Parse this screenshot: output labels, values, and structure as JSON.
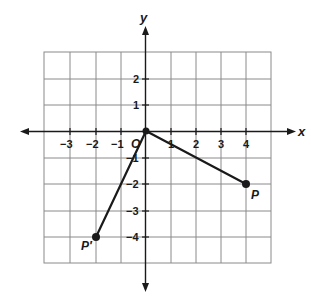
{
  "diagram": {
    "type": "coordinate-plane",
    "axes": {
      "x_label": "x",
      "y_label": "y",
      "x_ticks": [
        "−3",
        "−2",
        "−1",
        "1",
        "2",
        "3",
        "4"
      ],
      "y_ticks": [
        "2",
        "1",
        "−1",
        "−2",
        "−3",
        "−4"
      ],
      "grid_x_range": [
        -4,
        5
      ],
      "grid_y_range": [
        -5,
        3
      ]
    },
    "points": [
      {
        "name": "O",
        "label": "O",
        "x": 0,
        "y": 0
      },
      {
        "name": "P",
        "label": "P",
        "x": 4,
        "y": -2
      },
      {
        "name": "P'",
        "label": "P′",
        "x": -2,
        "y": -4
      }
    ],
    "segments": [
      {
        "from": "O",
        "to": "P"
      },
      {
        "from": "O",
        "to": "P'"
      }
    ],
    "colors": {
      "grid": "#8a8a8a",
      "axis": "#1a1a1a",
      "segment": "#1a1a1a"
    }
  }
}
